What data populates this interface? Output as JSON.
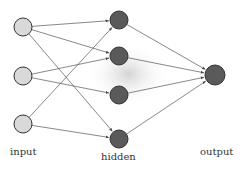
{
  "colors": {
    "input_fill": "#d9d9d9",
    "hidden_fill": "#5a5a5a",
    "output_fill": "#5a5a5a",
    "stroke": "#333333",
    "edge": "#555555",
    "glow": "#d0d0d0"
  },
  "layers": {
    "input": {
      "label": "input",
      "nodes": [
        {
          "id": "i1",
          "x": 23,
          "y": 27
        },
        {
          "id": "i2",
          "x": 23,
          "y": 76
        },
        {
          "id": "i3",
          "x": 23,
          "y": 124
        }
      ]
    },
    "hidden": {
      "label": "hidden",
      "nodes": [
        {
          "id": "h1",
          "x": 119,
          "y": 20
        },
        {
          "id": "h2",
          "x": 119,
          "y": 56
        },
        {
          "id": "h3",
          "x": 119,
          "y": 95
        },
        {
          "id": "h4",
          "x": 119,
          "y": 139
        }
      ]
    },
    "output": {
      "label": "output",
      "nodes": [
        {
          "id": "o1",
          "x": 215,
          "y": 75
        }
      ]
    }
  },
  "edges": [
    [
      "i1",
      "h1"
    ],
    [
      "i1",
      "h2"
    ],
    [
      "i1",
      "h4"
    ],
    [
      "i2",
      "h2"
    ],
    [
      "i2",
      "h3"
    ],
    [
      "i3",
      "h1"
    ],
    [
      "i3",
      "h4"
    ],
    [
      "h1",
      "o1"
    ],
    [
      "h2",
      "o1"
    ],
    [
      "h3",
      "o1"
    ],
    [
      "h4",
      "o1"
    ]
  ]
}
